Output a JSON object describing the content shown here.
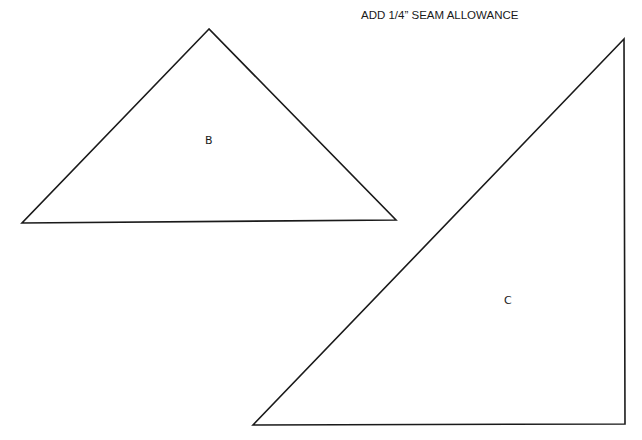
{
  "note": "ADD 1/4” SEAM ALLOWANCE",
  "pieces": [
    {
      "label": "B",
      "shape": "triangle",
      "vertices": [
        [
          209,
          29
        ],
        [
          22,
          223
        ],
        [
          396,
          220
        ]
      ],
      "label_position": [
        209,
        141
      ]
    },
    {
      "label": "C",
      "shape": "right-triangle",
      "vertices": [
        [
          624,
          39
        ],
        [
          253,
          425
        ],
        [
          625,
          424
        ]
      ],
      "label_position": [
        508,
        301
      ]
    }
  ],
  "colors": {
    "stroke": "#1a1a1a",
    "background": "#ffffff"
  }
}
